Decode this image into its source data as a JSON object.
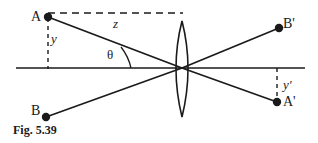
{
  "figure": {
    "caption": "Fig. 5.39",
    "type": "ray-diagram",
    "colors": {
      "ink": "#1a1a1a",
      "background": "#ffffff"
    },
    "labels": {
      "object_top": "A",
      "object_bottom": "B",
      "image_top": "B'",
      "image_bottom": "A'",
      "object_height": "y",
      "image_height": "y'",
      "object_distance": "z",
      "angle": "θ"
    },
    "points": {
      "A": {
        "x": 48,
        "y": 17
      },
      "B": {
        "x": 46,
        "y": 117
      },
      "Bp": {
        "x": 279,
        "y": 28
      },
      "Ap": {
        "x": 277,
        "y": 102
      },
      "lens_center": {
        "x": 182,
        "y": 68
      }
    },
    "geometry": {
      "axis_y": 68,
      "axis_x_start": 16,
      "axis_x_end": 305,
      "lens_top_y": 21,
      "lens_bottom_y": 117,
      "lens_center_x": 182,
      "lens_half_width": 10,
      "dashed_z_y": 13,
      "dashed_z_x_end": 183,
      "angle_arc_radius": 52
    }
  }
}
